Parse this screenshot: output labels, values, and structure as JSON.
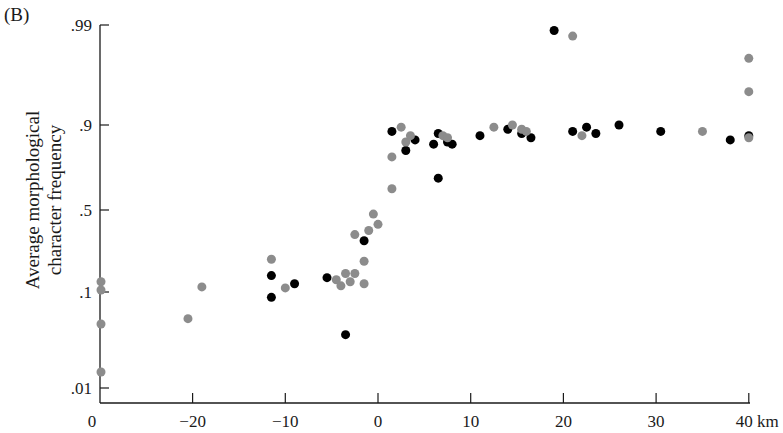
{
  "chart_data": {
    "type": "scatter",
    "panel_label": "(B)",
    "title": "",
    "xlabel": "km",
    "ylabel": "Average morphological character frequency",
    "ylabel_lines": [
      "Average morphological",
      "character frequency"
    ],
    "x_ticks": [
      {
        "value": -30,
        "label": "0"
      },
      {
        "value": -20,
        "label": "−20"
      },
      {
        "value": -10,
        "label": "−10"
      },
      {
        "value": 0,
        "label": "0"
      },
      {
        "value": 10,
        "label": "10"
      },
      {
        "value": 20,
        "label": "20"
      },
      {
        "value": 30,
        "label": "30"
      },
      {
        "value": 40,
        "label": "40 km"
      }
    ],
    "y_ticks": [
      {
        "value": 0.99,
        "label": ".99"
      },
      {
        "value": 0.9,
        "label": ".9"
      },
      {
        "value": 0.5,
        "label": ".5"
      },
      {
        "value": 0.1,
        "label": ".1"
      },
      {
        "value": 0.01,
        "label": ".01"
      }
    ],
    "y_scale": "probit",
    "xlim": [
      -30,
      40
    ],
    "ylim": [
      0.005,
      0.99
    ],
    "grid": false,
    "legend": null,
    "series": [
      {
        "name": "black",
        "color": "#000000",
        "points": [
          [
            -11.5,
            0.18
          ],
          [
            -11.5,
            0.095
          ],
          [
            -9,
            0.14
          ],
          [
            -5.5,
            0.17
          ],
          [
            -3.5,
            0.06
          ],
          [
            -1.5,
            0.35
          ],
          [
            1.5,
            0.87
          ],
          [
            3,
            0.78
          ],
          [
            4,
            0.83
          ],
          [
            6,
            0.81
          ],
          [
            6.5,
            0.65
          ],
          [
            6.5,
            0.86
          ],
          [
            7.5,
            0.82
          ],
          [
            8,
            0.81
          ],
          [
            11,
            0.85
          ],
          [
            14,
            0.88
          ],
          [
            15.5,
            0.86
          ],
          [
            16.5,
            0.84
          ],
          [
            19,
            0.985
          ],
          [
            21,
            0.87
          ],
          [
            22.5,
            0.89
          ],
          [
            23.5,
            0.86
          ],
          [
            26,
            0.9
          ],
          [
            30.5,
            0.87
          ],
          [
            38,
            0.83
          ],
          [
            40,
            0.85
          ]
        ]
      },
      {
        "name": "gray",
        "color": "#8c8c8c",
        "points": [
          [
            -30,
            0.15
          ],
          [
            -30,
            0.11
          ],
          [
            -30,
            0.07
          ],
          [
            -30,
            0.025
          ],
          [
            -20.5,
            0.075
          ],
          [
            -19,
            0.125
          ],
          [
            -11.5,
            0.26
          ],
          [
            -10,
            0.12
          ],
          [
            -4.5,
            0.16
          ],
          [
            -4,
            0.13
          ],
          [
            -3.5,
            0.19
          ],
          [
            -3,
            0.15
          ],
          [
            -2.5,
            0.19
          ],
          [
            -2.5,
            0.38
          ],
          [
            -1.5,
            0.25
          ],
          [
            -1.5,
            0.14
          ],
          [
            -1,
            0.4
          ],
          [
            -0.5,
            0.48
          ],
          [
            0,
            0.43
          ],
          [
            1.5,
            0.6
          ],
          [
            1.5,
            0.75
          ],
          [
            2.5,
            0.89
          ],
          [
            3,
            0.82
          ],
          [
            3.5,
            0.85
          ],
          [
            7,
            0.85
          ],
          [
            7.5,
            0.84
          ],
          [
            12.5,
            0.89
          ],
          [
            14.5,
            0.9
          ],
          [
            15.5,
            0.88
          ],
          [
            16,
            0.87
          ],
          [
            21,
            0.98
          ],
          [
            22,
            0.85
          ],
          [
            35,
            0.87
          ],
          [
            40,
            0.96
          ],
          [
            40,
            0.93
          ],
          [
            40,
            0.84
          ]
        ]
      }
    ]
  }
}
